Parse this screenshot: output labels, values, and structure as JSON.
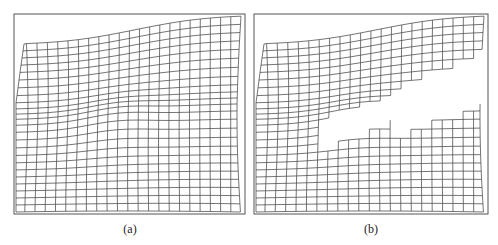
{
  "figure": {
    "panels": [
      {
        "id": "a",
        "caption": "(a)",
        "box": {
          "x": 14,
          "y": 14,
          "w": 231,
          "h": 200
        },
        "fracture": false
      },
      {
        "id": "b",
        "caption": "(b)",
        "box": {
          "x": 254,
          "y": 14,
          "w": 234,
          "h": 200
        },
        "fracture": true
      }
    ],
    "colors": {
      "line": "#3a3a3a",
      "frame": "#555555",
      "background": "#ffffff"
    },
    "mesh": {
      "cols": 22,
      "rows": 24
    }
  }
}
